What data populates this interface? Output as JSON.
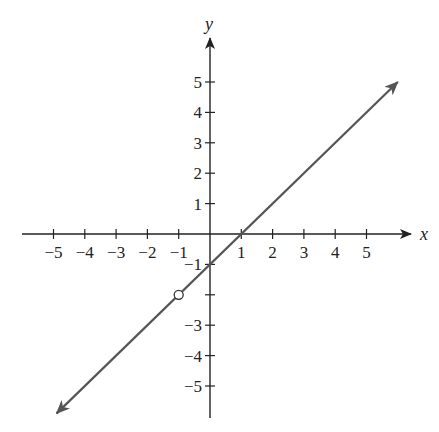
{
  "chart_data": {
    "type": "line",
    "title": "",
    "xlabel": "x",
    "ylabel": "y",
    "xlim": [
      -6,
      6
    ],
    "ylim": [
      -6,
      6
    ],
    "grid": false,
    "x_ticks": [
      -5,
      -4,
      -3,
      -2,
      -1,
      1,
      2,
      3,
      4,
      5
    ],
    "y_ticks": [
      5,
      4,
      3,
      2,
      1,
      -1,
      -3,
      -4,
      -5
    ],
    "x_tick_labels": [
      "−5",
      "−4",
      "−3",
      "−2",
      "−1",
      "1",
      "2",
      "3",
      "4",
      "5"
    ],
    "y_tick_labels": [
      "5",
      "4",
      "3",
      "2",
      "1",
      "−1",
      "−3",
      "−4",
      "−5"
    ],
    "series": [
      {
        "name": "y = x − 1 (excluding x = −1)",
        "equation": "y = x - 1",
        "slope": 1,
        "intercept": -1,
        "x": [
          -4.9,
          6.0
        ],
        "y": [
          -5.9,
          5.0
        ],
        "arrows_both_ends": true,
        "color": "#555555"
      }
    ],
    "annotations": [
      {
        "type": "open_circle",
        "x": -1,
        "y": -2,
        "note": "point excluded (hole)"
      }
    ]
  },
  "colors": {
    "axis": "#222222",
    "line": "#555555",
    "background": "#ffffff"
  }
}
